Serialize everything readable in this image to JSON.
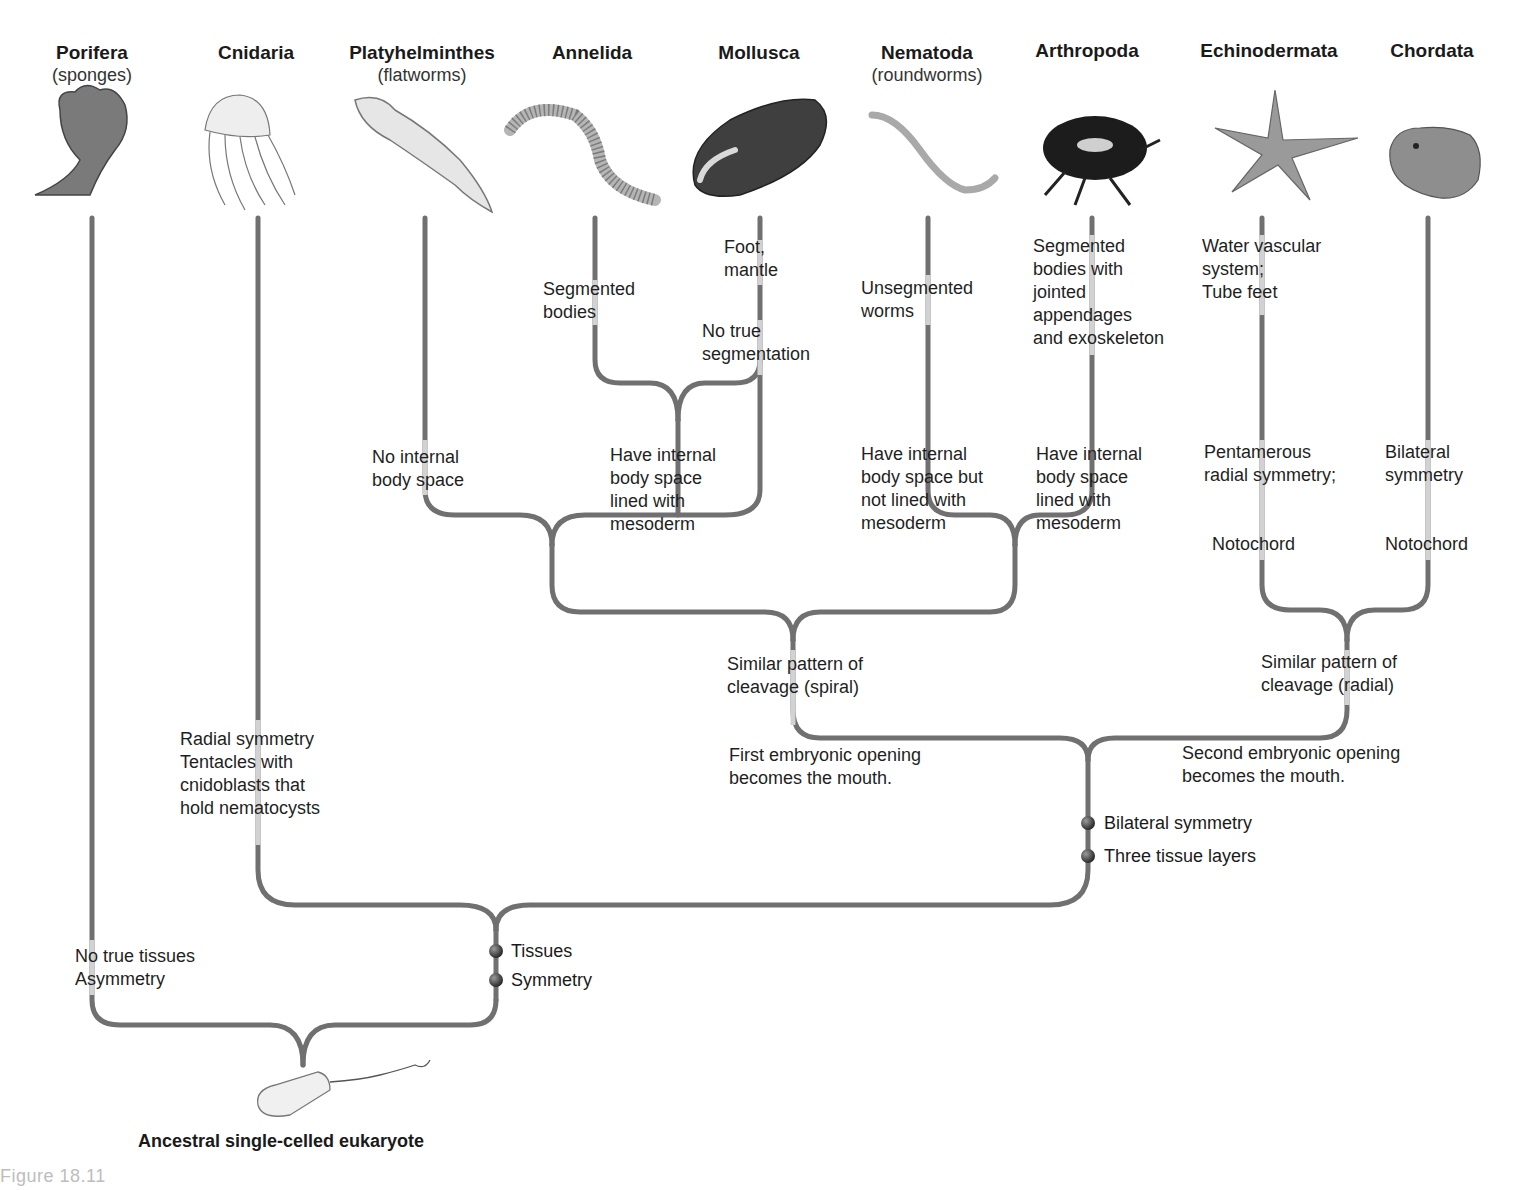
{
  "colors": {
    "line_dark": "#707070",
    "line_light": "#cfcfcf",
    "node": "#3a3a3a"
  },
  "phyla": [
    {
      "name": "Porifera",
      "common": "(sponges)",
      "x": 92,
      "icon": "sponge-icon"
    },
    {
      "name": "Cnidaria",
      "common": "",
      "x": 256,
      "icon": "jellyfish-icon"
    },
    {
      "name": "Platyhelminthes",
      "common": "(flatworms)",
      "x": 422,
      "icon": "flatworm-icon"
    },
    {
      "name": "Annelida",
      "common": "",
      "x": 592,
      "icon": "earthworm-icon"
    },
    {
      "name": "Mollusca",
      "common": "",
      "x": 759,
      "icon": "mussel-icon"
    },
    {
      "name": "Nematoda",
      "common": "(roundworms)",
      "x": 927,
      "icon": "roundworm-icon"
    },
    {
      "name": "Arthropoda",
      "common": "",
      "x": 1087,
      "icon": "beetle-icon"
    },
    {
      "name": "Echinodermata",
      "common": "",
      "x": 1269,
      "icon": "starfish-icon"
    },
    {
      "name": "Chordata",
      "common": "",
      "x": 1432,
      "icon": "frog-icon"
    }
  ],
  "labels": {
    "annelida_trait": "Segmented\nbodies",
    "mollusca_trait1": "Foot,\nmantle",
    "mollusca_trait2": "No true\nsegmentation",
    "nematoda_trait": "Unsegmented\nworms",
    "arthropoda_trait": "Segmented\nbodies with\njointed\nappendages\nand exoskeleton",
    "echinodermata_trait": "Water vascular\nsystem;\nTube feet",
    "platy_trait": "No internal\nbody space",
    "coelom_trait": "Have internal\nbody space\nlined with\nmesoderm",
    "pseudocoelom_trait": "Have internal\nbody space but\nnot lined with\nmesoderm",
    "arthropoda_coelom_trait": "Have internal\nbody space\nlined with\nmesoderm",
    "pentamerous": "Pentamerous\nradial symmetry;",
    "bilateral_chordata": "Bilateral\nsymmetry",
    "notochord_echino": "Notochord",
    "notochord_chordata": "Notochord",
    "spiral_cleavage": "Similar pattern of\ncleavage (spiral)",
    "radial_cleavage": "Similar pattern of\ncleavage (radial)",
    "protostome": "First embryonic opening\nbecomes the mouth.",
    "deuterostome": "Second embryonic opening\nbecomes the mouth.",
    "cnidaria_trait": "Radial symmetry\nTentacles with\ncnidoblasts that\nhold nematocysts",
    "porifera_trait": "No true tissues\nAsymmetry"
  },
  "markers": [
    {
      "label": "Bilateral symmetry",
      "x": 1088,
      "y": 823
    },
    {
      "label": "Three tissue layers",
      "x": 1088,
      "y": 856
    },
    {
      "label": "Tissues",
      "x": 496,
      "y": 951
    },
    {
      "label": "Symmetry",
      "x": 496,
      "y": 980
    }
  ],
  "ancestor": {
    "label": "Ancestral single-celled eukaryote",
    "icon": "flagellate-icon"
  },
  "caption": "Figure 18.11"
}
